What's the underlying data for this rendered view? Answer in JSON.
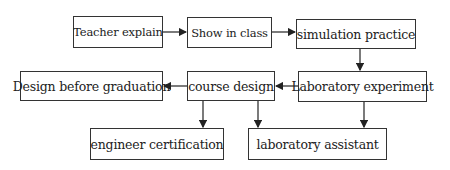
{
  "diagram": {
    "type": "flowchart",
    "nodes": [
      {
        "id": "teacher",
        "label": "Teacher explain"
      },
      {
        "id": "show",
        "label": "Show in class"
      },
      {
        "id": "simulation",
        "label": "simulation practice"
      },
      {
        "id": "lab_exp",
        "label": "Laboratory experiment"
      },
      {
        "id": "course",
        "label": "course design"
      },
      {
        "id": "design_grad",
        "label": "Design before graduation"
      },
      {
        "id": "engineer",
        "label": "engineer certification"
      },
      {
        "id": "lab_assist",
        "label": "laboratory assistant"
      }
    ],
    "edges": [
      {
        "from": "teacher",
        "to": "show"
      },
      {
        "from": "show",
        "to": "simulation"
      },
      {
        "from": "simulation",
        "to": "lab_exp"
      },
      {
        "from": "lab_exp",
        "to": "course"
      },
      {
        "from": "course",
        "to": "design_grad"
      },
      {
        "from": "course",
        "to": "engineer"
      },
      {
        "from": "course",
        "to": "lab_assist"
      },
      {
        "from": "lab_exp",
        "to": "lab_assist"
      }
    ]
  }
}
